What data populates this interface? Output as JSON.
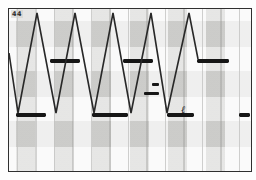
{
  "figure": {
    "corner_label": "44",
    "border_color": "#2f2f2f",
    "trace_color": "#282828",
    "bar_color": "#161616",
    "grid_color_major": "#9a9a98",
    "grid_color_minor": "#c3c3c1",
    "plot": {
      "x": 8,
      "y": 8,
      "w": 242,
      "h": 162
    }
  },
  "chart_data": {
    "type": "line",
    "title": "",
    "xlabel": "",
    "ylabel": "",
    "legend": "none",
    "grid": "vertical-only",
    "axis_ranges": {
      "x": [
        0,
        242
      ],
      "y": [
        0,
        162
      ]
    },
    "triangle_wave": {
      "points": [
        [
          0,
          44
        ],
        [
          9,
          104
        ],
        [
          28,
          4
        ],
        [
          47,
          104
        ],
        [
          66,
          4
        ],
        [
          85,
          104
        ],
        [
          104,
          4
        ],
        [
          122,
          104
        ],
        [
          142,
          4
        ],
        [
          158,
          104
        ],
        [
          180,
          4
        ],
        [
          189,
          50
        ]
      ],
      "peak_y": 4,
      "valley_y": 104,
      "stroke_width": 1.6
    },
    "output_levels": {
      "upper_level_y": 52,
      "lower_level_y": 106,
      "bar_thickness": 4,
      "upper_bars_x": [
        [
          41,
          71
        ],
        [
          114,
          144
        ],
        [
          188,
          220
        ]
      ],
      "lower_bars_x": [
        [
          7,
          37
        ],
        [
          83,
          119
        ],
        [
          158,
          185
        ],
        [
          230,
          241
        ]
      ]
    },
    "glitch_marks": [
      {
        "x": 143,
        "y": 74,
        "w": 7,
        "h": 3
      },
      {
        "x": 135,
        "y": 83,
        "w": 15,
        "h": 3
      }
    ],
    "squiggle_annotation": {
      "glyph": "ℓ",
      "x": 172,
      "y": 104,
      "font_size": 10
    },
    "gridlines_x": [
      8.5,
      27,
      45.5,
      64,
      82.5,
      101,
      119.5,
      138,
      156.5,
      175,
      193.5,
      212,
      230.5
    ]
  }
}
